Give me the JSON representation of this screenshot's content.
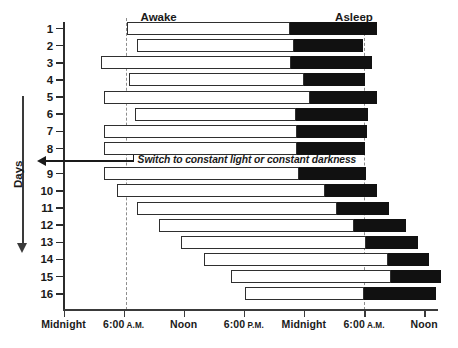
{
  "chart_data": {
    "type": "bar",
    "title": "",
    "subtitle": "",
    "xlabel": "",
    "ylabel": "Days",
    "xlim": [
      0,
      48
    ],
    "ylim": [
      1,
      16
    ],
    "grid": false,
    "legend_position": "top-inline",
    "x_unit": "hours",
    "x_tick_values": [
      0,
      6,
      12,
      18,
      24,
      30,
      36
    ],
    "x_tick_labels": [
      {
        "main": "Midnight",
        "ampm": ""
      },
      {
        "main": "6:00",
        "ampm": "A.M."
      },
      {
        "main": "Noon",
        "ampm": ""
      },
      {
        "main": "6:00",
        "ampm": "P.M."
      },
      {
        "main": "Midnight",
        "ampm": ""
      },
      {
        "main": "6:00",
        "ampm": "A.M."
      },
      {
        "main": "Noon",
        "ampm": ""
      }
    ],
    "y_tick_labels": [
      "1",
      "2",
      "3",
      "4",
      "5",
      "6",
      "7",
      "8",
      "9",
      "10",
      "11",
      "12",
      "13",
      "14",
      "15",
      "16"
    ],
    "phase_labels": [
      {
        "text": "Awake",
        "x_hours": 9.5
      },
      {
        "text": "Asleep",
        "x_hours": 29.0
      }
    ],
    "reference_lines": [
      {
        "x_hours": 6.2,
        "style": "dashed",
        "label": ""
      },
      {
        "x_hours": 30.0,
        "style": "dashed",
        "label": ""
      }
    ],
    "annotations": [
      {
        "text": "Switch to constant light or constant darkness",
        "between_days": [
          8,
          9
        ],
        "x_hours": 7.0
      }
    ],
    "series": [
      {
        "name": "Awake",
        "color": "#ffffff",
        "edge": "#2f2f2f"
      },
      {
        "name": "Asleep",
        "color": "#111111",
        "edge": "#111111"
      }
    ],
    "rows": [
      {
        "day": "1",
        "awake_start": 6.3,
        "awake_end": 22.6,
        "asleep_start": 22.6,
        "asleep_end": 31.3
      },
      {
        "day": "2",
        "awake_start": 7.3,
        "awake_end": 23.0,
        "asleep_start": 23.0,
        "asleep_end": 29.9
      },
      {
        "day": "3",
        "awake_start": 3.7,
        "awake_end": 22.7,
        "asleep_start": 22.7,
        "asleep_end": 30.8
      },
      {
        "day": "4",
        "awake_start": 6.5,
        "awake_end": 24.0,
        "asleep_start": 24.0,
        "asleep_end": 30.1
      },
      {
        "day": "5",
        "awake_start": 4.0,
        "awake_end": 24.6,
        "asleep_start": 24.6,
        "asleep_end": 31.3
      },
      {
        "day": "6",
        "awake_start": 7.1,
        "awake_end": 23.2,
        "asleep_start": 23.2,
        "asleep_end": 30.4
      },
      {
        "day": "7",
        "awake_start": 4.0,
        "awake_end": 23.3,
        "asleep_start": 23.3,
        "asleep_end": 30.3
      },
      {
        "day": "8",
        "awake_start": 4.0,
        "awake_end": 23.3,
        "asleep_start": 23.3,
        "asleep_end": 30.1
      },
      {
        "day": "9",
        "awake_start": 4.0,
        "awake_end": 23.5,
        "asleep_start": 23.5,
        "asleep_end": 30.2
      },
      {
        "day": "10",
        "awake_start": 5.3,
        "awake_end": 26.1,
        "asleep_start": 26.1,
        "asleep_end": 31.3
      },
      {
        "day": "11",
        "awake_start": 7.3,
        "awake_end": 27.3,
        "asleep_start": 27.3,
        "asleep_end": 32.5
      },
      {
        "day": "12",
        "awake_start": 9.5,
        "awake_end": 29.0,
        "asleep_start": 29.0,
        "asleep_end": 34.2
      },
      {
        "day": "13",
        "awake_start": 11.7,
        "awake_end": 30.2,
        "asleep_start": 30.2,
        "asleep_end": 35.4
      },
      {
        "day": "14",
        "awake_start": 14.0,
        "awake_end": 32.4,
        "asleep_start": 32.4,
        "asleep_end": 36.5
      },
      {
        "day": "15",
        "awake_start": 16.7,
        "awake_end": 32.7,
        "asleep_start": 32.7,
        "asleep_end": 37.7
      },
      {
        "day": "16",
        "awake_start": 18.1,
        "awake_end": 30.0,
        "asleep_start": 30.0,
        "asleep_end": 37.2
      }
    ]
  },
  "axis": {
    "days_label": "Days"
  }
}
